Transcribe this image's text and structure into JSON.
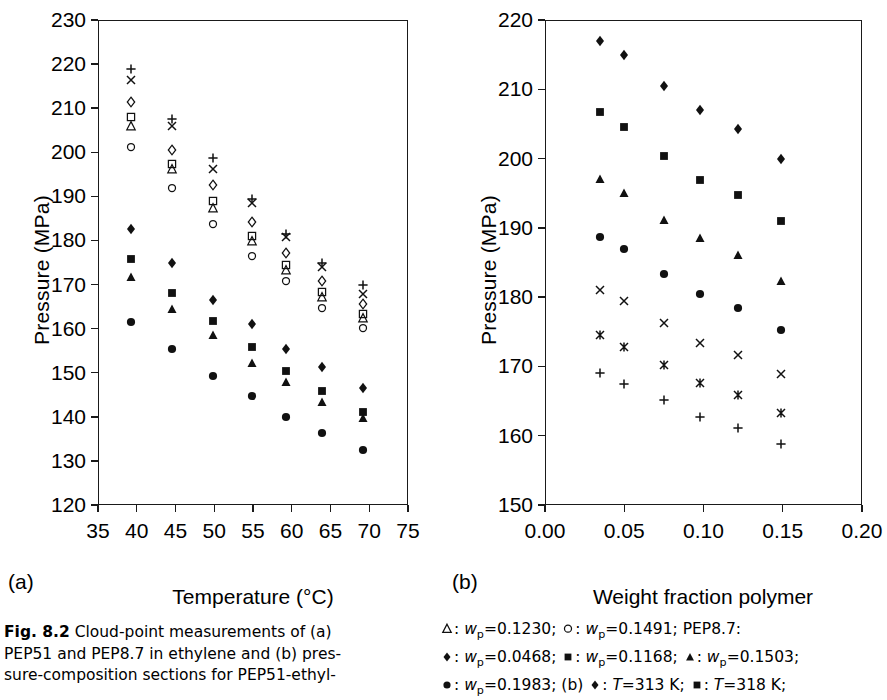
{
  "figure": {
    "number": "Fig. 8.2",
    "caption_lines": [
      "Cloud-point measurements of (a)",
      "PEP51 and PEP8.7 in ethylene and (b) pres-",
      "sure-composition sections for PEP51-ethyl-"
    ],
    "panel_a_label": "(a)",
    "panel_b_label": "(b)"
  },
  "legend_text": {
    "line1_parts": [
      "△",
      ": w",
      "p",
      "=0.1230; ",
      "○",
      ": w",
      "p",
      "=0.1491; PEP8.7:"
    ],
    "line1": "△: wp=0.1230;  ○: wp=0.1491;  PEP8.7:",
    "line2": "◆: wp=0.0468;  ■: wp=0.1168;  ▲: wp=0.1503;",
    "line3": "●: wp=0.1983;  (b)  ◆: T=313 K;  ■: T=318 K;",
    "entries": [
      {
        "symbol": "open-triangle",
        "glyph": "△",
        "var": "w",
        "sub": "p",
        "value": "0.1230"
      },
      {
        "symbol": "open-circle",
        "glyph": "○",
        "var": "w",
        "sub": "p",
        "value": "0.1491"
      },
      {
        "symbol": "filled-diamond",
        "glyph": "◆",
        "var": "w",
        "sub": "p",
        "value": "0.0468"
      },
      {
        "symbol": "filled-square",
        "glyph": "■",
        "var": "w",
        "sub": "p",
        "value": "0.1168"
      },
      {
        "symbol": "filled-triangle",
        "glyph": "▲",
        "var": "w",
        "sub": "p",
        "value": "0.1503"
      },
      {
        "symbol": "filled-circle",
        "glyph": "●",
        "var": "w",
        "sub": "p",
        "value": "0.1983"
      },
      {
        "symbol": "filled-diamond",
        "glyph": "◆",
        "var": "T",
        "sub": "",
        "value": "313 K"
      },
      {
        "symbol": "filled-square",
        "glyph": "■",
        "var": "T",
        "sub": "",
        "value": "318 K"
      }
    ],
    "sample_label": "PEP8.7:"
  },
  "chart_data": [
    {
      "id": "panel-a",
      "type": "scatter",
      "title": "",
      "xlabel": "Temperature (°C)",
      "ylabel": "Pressure (MPa)",
      "xlim": [
        35,
        75
      ],
      "ylim": [
        120,
        230
      ],
      "xticks": [
        35,
        40,
        45,
        50,
        55,
        60,
        65,
        70,
        75
      ],
      "yticks": [
        120,
        130,
        140,
        150,
        160,
        170,
        180,
        190,
        200,
        210,
        220,
        230
      ],
      "grid": false,
      "legend_position": "external-caption",
      "series": [
        {
          "name": "plus",
          "marker": "plus",
          "fill": "open",
          "points": [
            [
              39.3,
              218.9
            ],
            [
              44.6,
              207.6
            ],
            [
              49.8,
              198.6
            ],
            [
              54.9,
              189.4
            ],
            [
              59.3,
              181.4
            ],
            [
              63.9,
              174.8
            ],
            [
              69.2,
              169.8
            ]
          ]
        },
        {
          "name": "cross",
          "marker": "cross",
          "fill": "open",
          "points": [
            [
              39.3,
              216.5
            ],
            [
              44.6,
              205.9
            ],
            [
              49.8,
              196.2
            ],
            [
              54.9,
              188.6
            ],
            [
              59.3,
              180.8
            ],
            [
              63.9,
              174.0
            ],
            [
              69.2,
              167.8
            ]
          ]
        },
        {
          "name": "open-diamond",
          "marker": "diamond",
          "fill": "open",
          "points": [
            [
              39.3,
              211.4
            ],
            [
              44.6,
              200.6
            ],
            [
              49.8,
              192.5
            ],
            [
              54.9,
              184.2
            ],
            [
              59.3,
              177.2
            ],
            [
              63.9,
              170.8
            ],
            [
              69.2,
              165.6
            ]
          ]
        },
        {
          "name": "open-square",
          "marker": "square",
          "fill": "open",
          "points": [
            [
              39.3,
              208.1
            ],
            [
              44.6,
              197.4
            ],
            [
              49.8,
              189.0
            ],
            [
              54.9,
              180.9
            ],
            [
              59.3,
              174.5
            ],
            [
              63.9,
              168.2
            ],
            [
              69.2,
              163.3
            ]
          ]
        },
        {
          "name": "open-triangle",
          "marker": "triangle",
          "fill": "open",
          "points": [
            [
              39.3,
              205.9
            ],
            [
              44.6,
              196.1
            ],
            [
              49.8,
              187.3
            ],
            [
              54.9,
              179.8
            ],
            [
              59.3,
              173.3
            ],
            [
              63.9,
              167.2
            ],
            [
              69.2,
              162.3
            ]
          ]
        },
        {
          "name": "open-circle",
          "marker": "circle",
          "fill": "open",
          "points": [
            [
              39.3,
              201.2
            ],
            [
              44.6,
              191.8
            ],
            [
              49.8,
              183.8
            ],
            [
              54.9,
              176.5
            ],
            [
              59.3,
              170.9
            ],
            [
              63.9,
              164.6
            ],
            [
              69.2,
              160.2
            ]
          ]
        },
        {
          "name": "filled-diamond",
          "marker": "diamond",
          "fill": "filled",
          "points": [
            [
              39.3,
              182.7
            ],
            [
              44.6,
              174.8
            ],
            [
              49.8,
              166.5
            ],
            [
              54.9,
              161.1
            ],
            [
              59.3,
              155.4
            ],
            [
              63.9,
              151.2
            ],
            [
              69.2,
              146.5
            ]
          ]
        },
        {
          "name": "filled-square",
          "marker": "square",
          "fill": "filled",
          "points": [
            [
              39.3,
              175.8
            ],
            [
              44.6,
              168.1
            ],
            [
              49.8,
              161.8
            ],
            [
              54.9,
              155.8
            ],
            [
              59.3,
              150.5
            ],
            [
              63.9,
              145.8
            ],
            [
              69.2,
              141.2
            ]
          ]
        },
        {
          "name": "filled-triangle",
          "marker": "triangle",
          "fill": "filled",
          "points": [
            [
              39.3,
              171.6
            ],
            [
              44.6,
              164.4
            ],
            [
              49.8,
              158.6
            ],
            [
              54.9,
              152.3
            ],
            [
              59.3,
              148.0
            ],
            [
              63.9,
              143.3
            ],
            [
              69.2,
              139.7
            ]
          ]
        },
        {
          "name": "filled-circle",
          "marker": "circle",
          "fill": "filled",
          "points": [
            [
              39.3,
              161.5
            ],
            [
              44.6,
              155.3
            ],
            [
              49.8,
              149.3
            ],
            [
              54.9,
              144.7
            ],
            [
              59.3,
              139.9
            ],
            [
              63.9,
              136.4
            ],
            [
              69.2,
              132.5
            ]
          ]
        }
      ]
    },
    {
      "id": "panel-b",
      "type": "scatter",
      "title": "",
      "xlabel": "Weight fraction polymer",
      "ylabel": "Pressure (MPa)",
      "xlim": [
        0.0,
        0.2
      ],
      "ylim": [
        150,
        220
      ],
      "xticks": [
        0.0,
        0.05,
        0.1,
        0.15,
        0.2
      ],
      "yticks": [
        150,
        160,
        170,
        180,
        190,
        200,
        210,
        220
      ],
      "grid": false,
      "legend_position": "external-caption",
      "series": [
        {
          "name": "filled-diamond",
          "marker": "diamond",
          "fill": "filled",
          "points": [
            [
              0.035,
              216.9
            ],
            [
              0.05,
              215.0
            ],
            [
              0.075,
              210.5
            ],
            [
              0.098,
              207.0
            ],
            [
              0.122,
              204.3
            ],
            [
              0.149,
              199.9
            ]
          ]
        },
        {
          "name": "filled-square",
          "marker": "square",
          "fill": "filled",
          "points": [
            [
              0.035,
              206.7
            ],
            [
              0.05,
              204.5
            ],
            [
              0.075,
              200.4
            ],
            [
              0.098,
              196.9
            ],
            [
              0.122,
              194.8
            ],
            [
              0.149,
              191.0
            ]
          ]
        },
        {
          "name": "filled-triangle",
          "marker": "triangle",
          "fill": "filled",
          "points": [
            [
              0.035,
              197.0
            ],
            [
              0.05,
              195.0
            ],
            [
              0.075,
              191.2
            ],
            [
              0.098,
              188.5
            ],
            [
              0.122,
              186.1
            ],
            [
              0.149,
              182.3
            ]
          ]
        },
        {
          "name": "filled-circle",
          "marker": "circle",
          "fill": "filled",
          "points": [
            [
              0.035,
              188.7
            ],
            [
              0.05,
              186.9
            ],
            [
              0.075,
              183.3
            ],
            [
              0.098,
              180.4
            ],
            [
              0.122,
              178.5
            ],
            [
              0.149,
              175.3
            ]
          ]
        },
        {
          "name": "cross",
          "marker": "cross",
          "fill": "open",
          "points": [
            [
              0.035,
              181.1
            ],
            [
              0.05,
              179.4
            ],
            [
              0.075,
              176.2
            ],
            [
              0.098,
              173.4
            ],
            [
              0.122,
              171.6
            ],
            [
              0.149,
              168.9
            ]
          ]
        },
        {
          "name": "asterisk",
          "marker": "asterisk",
          "fill": "open",
          "points": [
            [
              0.035,
              174.5
            ],
            [
              0.05,
              172.8
            ],
            [
              0.075,
              170.2
            ],
            [
              0.098,
              167.6
            ],
            [
              0.122,
              165.9
            ],
            [
              0.149,
              163.3
            ]
          ]
        },
        {
          "name": "plus",
          "marker": "plus",
          "fill": "open",
          "points": [
            [
              0.035,
              169.1
            ],
            [
              0.05,
              167.5
            ],
            [
              0.075,
              165.1
            ],
            [
              0.098,
              162.7
            ],
            [
              0.122,
              161.1
            ],
            [
              0.149,
              158.8
            ]
          ]
        }
      ]
    }
  ]
}
